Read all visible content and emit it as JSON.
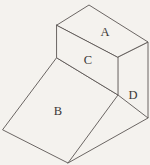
{
  "figure": {
    "background_color": "#f4f2ee",
    "line_color": "#5b5653",
    "label_color": "#3b3836",
    "canvas": {
      "width": 150,
      "height": 165
    },
    "faces": [
      {
        "id": "A",
        "label": "A",
        "name": "top-face",
        "points": "57,25 89,5 148,42 118,57",
        "label_x": 105,
        "label_y": 33
      },
      {
        "id": "D",
        "label": "D",
        "name": "right-side-face",
        "points": "118,57 148,42 148,118 118,95",
        "label_x": 133,
        "label_y": 96
      },
      {
        "id": "C",
        "label": "C",
        "name": "front-upper-face",
        "points": "57,25 118,57 118,95 57,58",
        "label_x": 88,
        "label_y": 61
      },
      {
        "id": "B",
        "label": "B",
        "name": "inclined-ramp-face",
        "points": "57,58 118,95 68,163 3,130",
        "label_x": 58,
        "label_y": 112
      }
    ],
    "extra_edges": [
      {
        "name": "bottom-right-edge",
        "x1": 68,
        "y1": 163,
        "x2": 148,
        "y2": 118
      }
    ]
  }
}
